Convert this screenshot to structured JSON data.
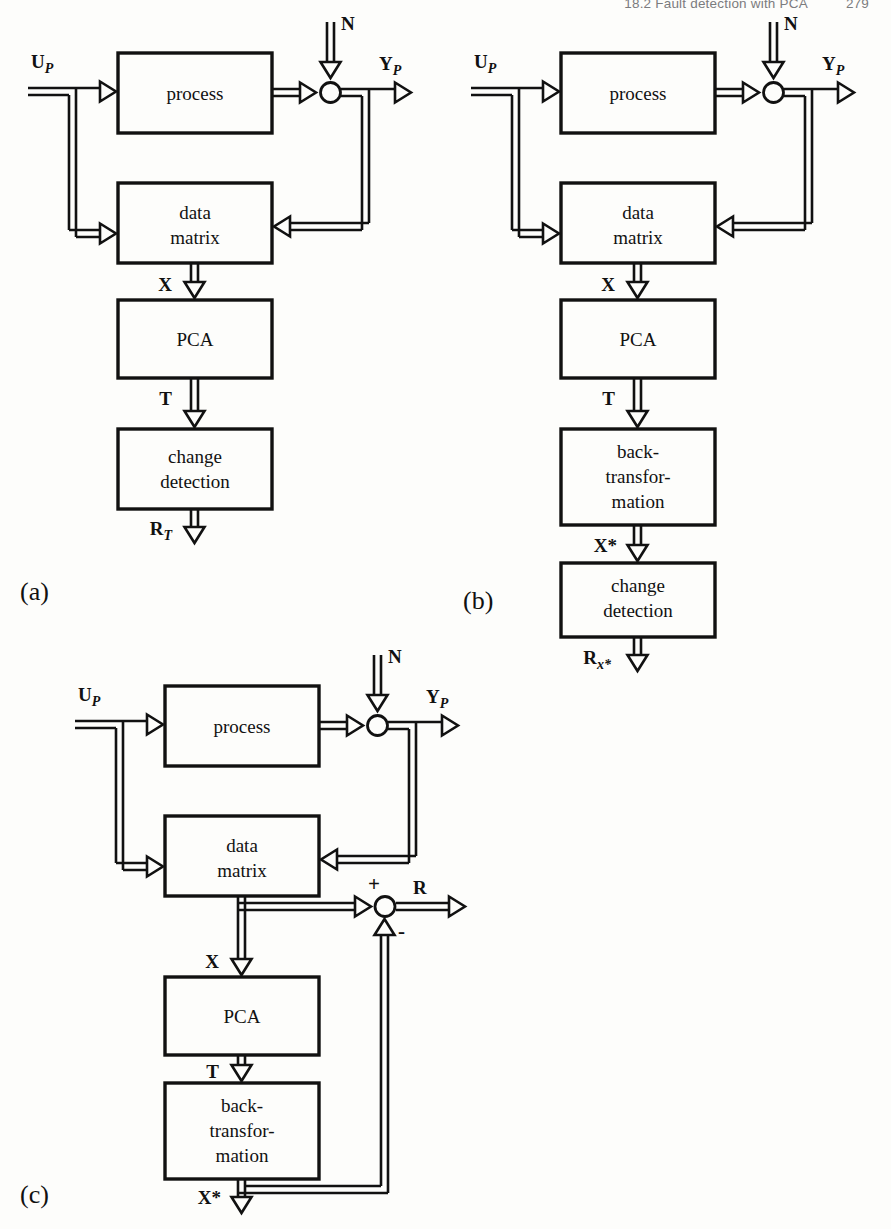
{
  "header": {
    "section": "18.2  Fault detection with PCA",
    "page_number": "279"
  },
  "figure": {
    "panels": [
      {
        "id": "a",
        "label": "(a)",
        "blocks": [
          {
            "name": "process",
            "lines": [
              "process"
            ]
          },
          {
            "name": "data-matrix",
            "lines": [
              "data",
              "matrix"
            ]
          },
          {
            "name": "pca",
            "lines": [
              "PCA"
            ]
          },
          {
            "name": "change-detection",
            "lines": [
              "change",
              "detection"
            ]
          }
        ],
        "signals": [
          {
            "name": "input-u",
            "base": "U",
            "sub": "P"
          },
          {
            "name": "noise-n",
            "base": "N",
            "sub": ""
          },
          {
            "name": "output-y",
            "base": "Y",
            "sub": "P"
          },
          {
            "name": "data-matrix-x",
            "base": "X",
            "sub": ""
          },
          {
            "name": "scores-t",
            "base": "T",
            "sub": ""
          },
          {
            "name": "residual-rt",
            "base": "R",
            "sub": "T"
          }
        ],
        "junction": {
          "name": "sum-junction",
          "signs": []
        }
      },
      {
        "id": "b",
        "label": "(b)",
        "blocks": [
          {
            "name": "process",
            "lines": [
              "process"
            ]
          },
          {
            "name": "data-matrix",
            "lines": [
              "data",
              "matrix"
            ]
          },
          {
            "name": "pca",
            "lines": [
              "PCA"
            ]
          },
          {
            "name": "back-transformation",
            "lines": [
              "back-",
              "transfor-",
              "mation"
            ]
          },
          {
            "name": "change-detection",
            "lines": [
              "change",
              "detection"
            ]
          }
        ],
        "signals": [
          {
            "name": "input-u",
            "base": "U",
            "sub": "P"
          },
          {
            "name": "noise-n",
            "base": "N",
            "sub": ""
          },
          {
            "name": "output-y",
            "base": "Y",
            "sub": "P"
          },
          {
            "name": "data-matrix-x",
            "base": "X",
            "sub": ""
          },
          {
            "name": "scores-t",
            "base": "T",
            "sub": ""
          },
          {
            "name": "reconstructed-x",
            "base": "X*",
            "sub": ""
          },
          {
            "name": "residual-rxstar",
            "base": "R",
            "sub": "x*"
          }
        ],
        "junction": {
          "name": "sum-junction",
          "signs": []
        }
      },
      {
        "id": "c",
        "label": "(c)",
        "blocks": [
          {
            "name": "process",
            "lines": [
              "process"
            ]
          },
          {
            "name": "data-matrix",
            "lines": [
              "data",
              "matrix"
            ]
          },
          {
            "name": "pca",
            "lines": [
              "PCA"
            ]
          },
          {
            "name": "back-transformation",
            "lines": [
              "back-",
              "transfor-",
              "mation"
            ]
          }
        ],
        "signals": [
          {
            "name": "input-u",
            "base": "U",
            "sub": "P"
          },
          {
            "name": "noise-n",
            "base": "N",
            "sub": ""
          },
          {
            "name": "output-y",
            "base": "Y",
            "sub": "P"
          },
          {
            "name": "data-matrix-x",
            "base": "X",
            "sub": ""
          },
          {
            "name": "scores-t",
            "base": "T",
            "sub": ""
          },
          {
            "name": "reconstructed-x",
            "base": "X*",
            "sub": ""
          },
          {
            "name": "residual-r",
            "base": "R",
            "sub": ""
          }
        ],
        "junction": {
          "name": "difference-junction",
          "signs": [
            "+",
            "-"
          ]
        }
      }
    ]
  },
  "colors": {
    "ink": "#111111",
    "paper": "#fdfdfb",
    "header_text": "#5f6063"
  }
}
